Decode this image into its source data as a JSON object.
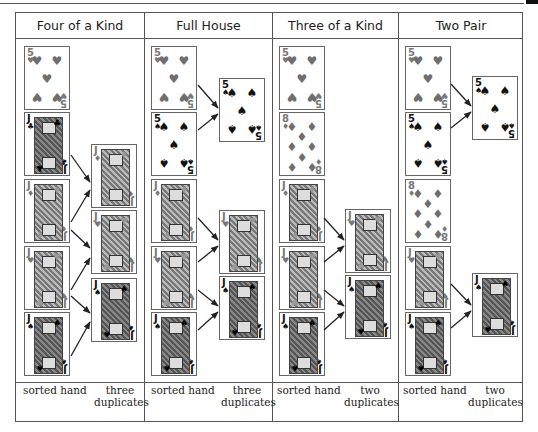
{
  "columns": [
    {
      "title": "Four of a Kind",
      "footer_left": "sorted hand",
      "footer_right_line1": "three",
      "footer_right_line2": "duplicates",
      "sorted_hand": [
        {
          "rank": "5",
          "suit": "♥",
          "color": "red"
        },
        {
          "rank": "J",
          "suit": "♣",
          "color": "black"
        },
        {
          "rank": "J",
          "suit": "♦",
          "color": "red"
        },
        {
          "rank": "J",
          "suit": "♥",
          "color": "red"
        },
        {
          "rank": "J",
          "suit": "♠",
          "color": "black"
        }
      ],
      "duplicates": [
        {
          "rank": "J",
          "suit": "♦",
          "color": "red"
        },
        {
          "rank": "J",
          "suit": "♥",
          "color": "red"
        },
        {
          "rank": "J",
          "suit": "♠",
          "color": "black"
        }
      ]
    },
    {
      "title": "Full House",
      "footer_left": "sorted hand",
      "footer_right_line1": "three",
      "footer_right_line2": "duplicates",
      "sorted_hand": [
        {
          "rank": "5",
          "suit": "♥",
          "color": "red"
        },
        {
          "rank": "5",
          "suit": "♠",
          "color": "black"
        },
        {
          "rank": "J",
          "suit": "♦",
          "color": "red"
        },
        {
          "rank": "J",
          "suit": "♥",
          "color": "red"
        },
        {
          "rank": "J",
          "suit": "♠",
          "color": "black"
        }
      ],
      "duplicates": [
        {
          "rank": "5",
          "suit": "♠",
          "color": "black"
        },
        {
          "rank": "J",
          "suit": "♥",
          "color": "red"
        },
        {
          "rank": "J",
          "suit": "♠",
          "color": "black"
        }
      ]
    },
    {
      "title": "Three of a Kind",
      "footer_left": "sorted hand",
      "footer_right_line1": "two",
      "footer_right_line2": "duplicates",
      "sorted_hand": [
        {
          "rank": "5",
          "suit": "♥",
          "color": "red"
        },
        {
          "rank": "8",
          "suit": "♦",
          "color": "red"
        },
        {
          "rank": "J",
          "suit": "♦",
          "color": "red"
        },
        {
          "rank": "J",
          "suit": "♥",
          "color": "red"
        },
        {
          "rank": "J",
          "suit": "♠",
          "color": "black"
        }
      ],
      "duplicates": [
        {
          "rank": "J",
          "suit": "♥",
          "color": "red"
        },
        {
          "rank": "J",
          "suit": "♠",
          "color": "black"
        }
      ]
    },
    {
      "title": "Two Pair",
      "footer_left": "sorted hand",
      "footer_right_line1": "two",
      "footer_right_line2": "duplicates",
      "sorted_hand": [
        {
          "rank": "5",
          "suit": "♥",
          "color": "red"
        },
        {
          "rank": "5",
          "suit": "♠",
          "color": "black"
        },
        {
          "rank": "8",
          "suit": "♦",
          "color": "red"
        },
        {
          "rank": "J",
          "suit": "♥",
          "color": "red"
        },
        {
          "rank": "J",
          "suit": "♠",
          "color": "black"
        }
      ],
      "duplicates": [
        {
          "rank": "5",
          "suit": "♠",
          "color": "black"
        },
        {
          "rank": "J",
          "suit": "♠",
          "color": "black"
        }
      ]
    }
  ],
  "colors": {
    "border": "#555555",
    "red_suit": "#777777",
    "black_suit": "#111111"
  }
}
